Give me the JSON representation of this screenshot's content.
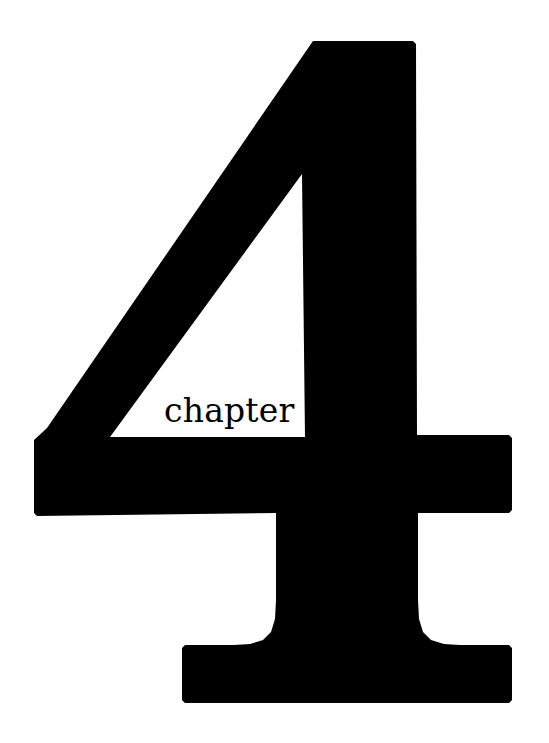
{
  "page": {
    "kind": "book-chapter-opening-page",
    "background_color": "#ffffff",
    "ink_color": "#000000",
    "width": 549,
    "height": 743
  },
  "chapter_opener": {
    "number": "4",
    "label": "chapter",
    "numeral_glyph_name": "numeral-four",
    "numeral_color": "#000000",
    "label_color": "#000000"
  }
}
